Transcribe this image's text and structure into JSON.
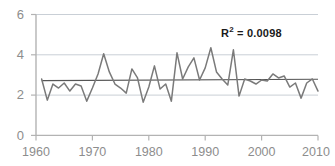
{
  "chart_data": {
    "type": "line",
    "title": "",
    "xlabel": "",
    "ylabel": "",
    "xlim": [
      1960,
      2010
    ],
    "ylim": [
      0,
      6
    ],
    "yticks": [
      0,
      2,
      4,
      6
    ],
    "xticks": [
      1960,
      1970,
      1980,
      1990,
      2000,
      2010
    ],
    "grid": true,
    "legend": false,
    "annotations": [
      {
        "name": "r-squared",
        "text_prefix": "R",
        "text_sup": "2",
        "text_suffix": " = 0.0098",
        "value": 0.0098
      }
    ],
    "series": [
      {
        "name": "annual-series",
        "color": "#7a7a7a",
        "x": [
          1961,
          1962,
          1963,
          1964,
          1965,
          1966,
          1967,
          1968,
          1969,
          1970,
          1971,
          1972,
          1973,
          1974,
          1975,
          1976,
          1977,
          1978,
          1979,
          1980,
          1981,
          1982,
          1983,
          1984,
          1985,
          1986,
          1987,
          1988,
          1989,
          1990,
          1991,
          1992,
          1993,
          1994,
          1995,
          1996,
          1997,
          1998,
          1999,
          2000,
          2001,
          2002,
          2003,
          2004,
          2005,
          2006,
          2007,
          2008,
          2009,
          2010
        ],
        "values": [
          2.8,
          1.75,
          2.55,
          2.35,
          2.6,
          2.2,
          2.55,
          2.45,
          1.7,
          2.35,
          3.05,
          4.05,
          3.15,
          2.55,
          2.35,
          2.1,
          3.3,
          2.85,
          1.65,
          2.4,
          3.45,
          2.3,
          2.55,
          1.7,
          4.1,
          2.8,
          3.4,
          3.85,
          2.75,
          3.35,
          4.35,
          3.15,
          2.8,
          2.5,
          4.25,
          1.95,
          2.8,
          2.7,
          2.55,
          2.75,
          2.7,
          3.05,
          2.85,
          2.95,
          2.4,
          2.6,
          1.85,
          2.6,
          2.8,
          2.2
        ]
      },
      {
        "name": "linear-trend",
        "color": "#555555",
        "type": "trendline",
        "x": [
          1961,
          2010
        ],
        "values": [
          2.72,
          2.79
        ]
      }
    ]
  },
  "axis": {
    "y_tick_labels": [
      "6",
      "4",
      "2",
      "0"
    ],
    "x_tick_labels": [
      "1960",
      "1970",
      "1980",
      "1990",
      "2000",
      "2010"
    ]
  },
  "colors": {
    "series": "#7a7a7a",
    "trend": "#555555",
    "grid": "#c9cfd6",
    "axis": "#b3b3b3",
    "tick_text": "#8d8d8d",
    "annotation": "#1a1a1a"
  }
}
